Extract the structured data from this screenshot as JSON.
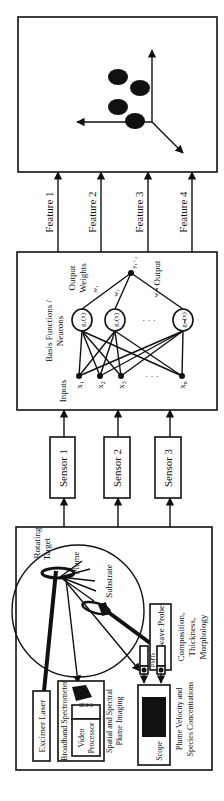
{
  "figure": {
    "orientation": "rotated-90-ccw",
    "apparatus": {
      "labels": {
        "rotating_target": [
          "Rotating",
          "Target"
        ],
        "plume": "Plume",
        "substrate": "Substrate",
        "excimer_laser": "Excimer Laser",
        "spectrometer": "Broadband Spectrometer",
        "ccd": "CCD",
        "video_processor": [
          "Video",
          "Processor"
        ],
        "imaging": [
          "Spatial and Spectral",
          "Plume Imaging"
        ],
        "pmts": "PMTs",
        "scope": "Scope",
        "velocity": [
          "Plume Velocity and",
          "Species Concentrations"
        ],
        "microwave": "Microwave Probe",
        "composition": [
          "Composition,",
          "Thickness,",
          "Morphology"
        ]
      }
    },
    "sensors": [
      {
        "label": "Sensor 1"
      },
      {
        "label": "Sensor 2"
      },
      {
        "label": "Sensor 3"
      }
    ],
    "network": {
      "title": [
        "Basis Functions /",
        "Neurons"
      ],
      "inputs_label": "Inputs",
      "inputs": [
        "x",
        "x",
        "x",
        "x"
      ],
      "input_subs": [
        "1",
        "2",
        "3",
        "n"
      ],
      "neurons": [
        "g₁(x)",
        "g₂(x)",
        "gₘ(x)"
      ],
      "output_weights_label": [
        "Output",
        "Weights"
      ],
      "weights": [
        "w₁",
        "w₂",
        "wₘ"
      ],
      "output_node": "y₁₋₄",
      "output_label": "Output",
      "ellipsis": "·  ·  ·"
    },
    "features": [
      {
        "label": "Feature 1"
      },
      {
        "label": "Feature 2"
      },
      {
        "label": "Feature 3"
      },
      {
        "label": "Feature 4"
      }
    ],
    "feature_space": {
      "description": "3D axes with four clustered points",
      "points": 4
    }
  }
}
